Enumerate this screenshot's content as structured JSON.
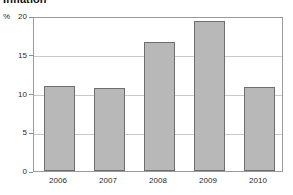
{
  "chart_data": {
    "type": "bar",
    "title": "Inflation",
    "xlabel": "",
    "ylabel": "",
    "unit_label": "%",
    "categories": [
      "2006",
      "2007",
      "2008",
      "2009",
      "2010"
    ],
    "values": [
      11.0,
      10.7,
      16.6,
      19.4,
      10.8
    ],
    "series": [
      {
        "name": "Inflation",
        "values": [
          11.0,
          10.7,
          16.6,
          19.4,
          10.8
        ]
      }
    ],
    "ylim": [
      0,
      20
    ],
    "yticks": [
      0,
      5,
      10,
      15,
      20
    ],
    "ytick_labels": [
      "0",
      "5",
      "10",
      "15",
      "20"
    ],
    "grid": true,
    "grid_axis": "y",
    "legend": false,
    "legend_position": "none",
    "bar_color": "#b8b8b8",
    "bar_edge_color": "#6e6e6e",
    "gridline_color": "#c9c9c9",
    "axis_color": "#9a9a9a",
    "text_color": "#2a2a2a"
  }
}
